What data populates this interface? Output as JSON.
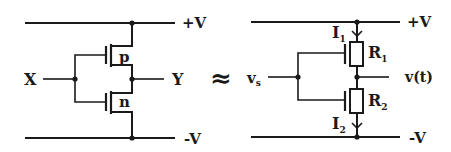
{
  "diagram": {
    "type": "circuit-equivalence",
    "left_circuit": {
      "name": "CMOS inverter",
      "input_label": "X",
      "output_label": "Y",
      "supply_top": "+V",
      "supply_bottom": "-V",
      "transistors": [
        {
          "type_label": "p"
        },
        {
          "type_label": "n"
        }
      ]
    },
    "relation_symbol": "≈",
    "right_circuit": {
      "name": "resistive equivalent",
      "input_label": "v",
      "input_sub": "s",
      "output_label": "v(t)",
      "supply_top": "+V",
      "supply_bottom": "-V",
      "resistors": [
        {
          "label": "R",
          "sub": "1"
        },
        {
          "label": "R",
          "sub": "2"
        }
      ],
      "currents": [
        {
          "label": "I",
          "sub": "1"
        },
        {
          "label": "I",
          "sub": "2"
        }
      ]
    },
    "colors": {
      "ink": "#1a1a1a",
      "background": "#ffffff"
    }
  }
}
